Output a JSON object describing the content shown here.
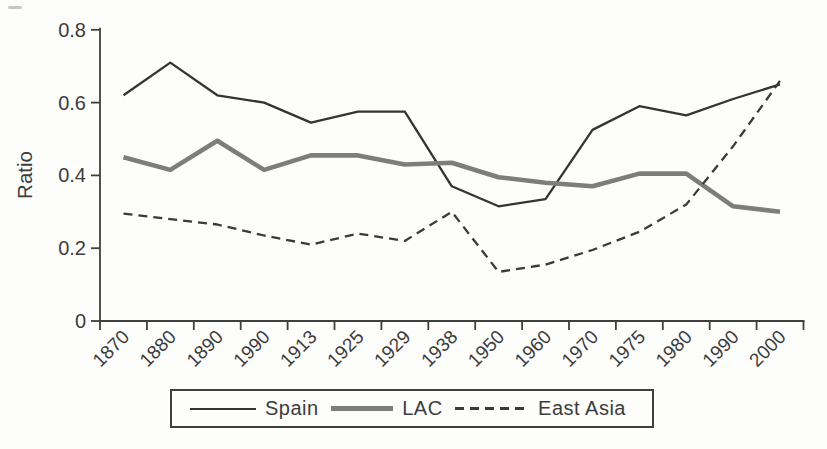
{
  "chart_data": {
    "type": "line",
    "title": "",
    "xlabel": "",
    "ylabel": "Ratio",
    "ylim": [
      0,
      0.8
    ],
    "ytick_values": [
      0,
      0.2,
      0.4,
      0.6,
      0.8
    ],
    "ytick_labels": [
      "0",
      "0.2",
      "0.4",
      "0.6",
      "0.8"
    ],
    "categories": [
      "1870",
      "1880",
      "1890",
      "1990",
      "1913",
      "1925",
      "1929",
      "1938",
      "1950",
      "1960",
      "1970",
      "1975",
      "1980",
      "1990",
      "2000"
    ],
    "grid": "off",
    "legend_position": "bottom",
    "axis_color": "#3f3f3f",
    "series": [
      {
        "name": "Spain",
        "style": "solid",
        "color": "#343434",
        "values": [
          0.62,
          0.71,
          0.62,
          0.6,
          0.545,
          0.575,
          0.575,
          0.37,
          0.315,
          0.335,
          0.525,
          0.59,
          0.565,
          0.61,
          0.65
        ]
      },
      {
        "name": "LAC",
        "style": "solid-thick",
        "color": "#7d7d7d",
        "values": [
          0.45,
          0.415,
          0.495,
          0.415,
          0.455,
          0.455,
          0.43,
          0.435,
          0.395,
          0.38,
          0.37,
          0.405,
          0.405,
          0.315,
          0.3
        ]
      },
      {
        "name": "East Asia",
        "style": "dashed",
        "color": "#3a3a3a",
        "values": [
          0.295,
          0.28,
          0.265,
          0.235,
          0.21,
          0.24,
          0.22,
          0.3,
          0.135,
          0.155,
          0.195,
          0.245,
          0.32,
          0.48,
          0.66
        ]
      }
    ]
  }
}
